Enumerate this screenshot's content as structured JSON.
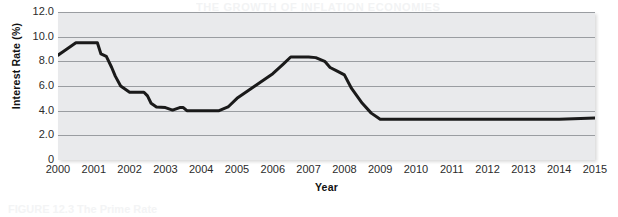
{
  "figure": {
    "background_color": "#ffffff",
    "plot_background_color": "#e9eaec",
    "gridline_color": "#9a9da1",
    "series_color": "#1a1a1a",
    "ghost_text_top": "THE GROWTH OF INFLATION ECONOMIES",
    "ghost_text_bottom": "FIGURE 12.3 The Prime Rate"
  },
  "chart_data": {
    "type": "line",
    "title": "",
    "xlabel": "Year",
    "ylabel": "Interest Rate (%)",
    "xlim": [
      2000,
      2015
    ],
    "ylim": [
      0,
      12
    ],
    "grid": true,
    "legend": "none",
    "ytick_labels": [
      "12.0",
      "10.0",
      "8.0",
      "6.0",
      "4.0",
      "2.0",
      "0"
    ],
    "ytick_values": [
      12,
      10,
      8,
      6,
      4,
      2,
      0
    ],
    "xtick_labels": [
      "2000",
      "2001",
      "2002",
      "2003",
      "2004",
      "2005",
      "2006",
      "2007",
      "2008",
      "2009",
      "2010",
      "2011",
      "2012",
      "2013",
      "2014",
      "2015"
    ],
    "xtick_values": [
      2000,
      2001,
      2002,
      2003,
      2004,
      2005,
      2006,
      2007,
      2008,
      2009,
      2010,
      2011,
      2012,
      2013,
      2014,
      2015
    ],
    "series": [
      {
        "name": "Interest Rate",
        "x": [
          2000.0,
          2000.15,
          2000.35,
          2000.5,
          2000.6,
          2000.75,
          2001.0,
          2001.1,
          2001.2,
          2001.35,
          2001.5,
          2001.6,
          2001.75,
          2002.0,
          2002.4,
          2002.5,
          2002.6,
          2002.75,
          2003.0,
          2003.2,
          2003.4,
          2003.5,
          2003.6,
          2004.0,
          2004.5,
          2004.75,
          2005.0,
          2005.5,
          2006.0,
          2006.3,
          2006.5,
          2007.0,
          2007.2,
          2007.45,
          2007.6,
          2007.8,
          2008.0,
          2008.2,
          2008.5,
          2008.75,
          2009.0,
          2010.0,
          2011.0,
          2012.0,
          2013.0,
          2014.0,
          2015.0
        ],
        "y": [
          8.5,
          8.8,
          9.2,
          9.5,
          9.5,
          9.5,
          9.5,
          9.5,
          8.6,
          8.4,
          7.5,
          6.8,
          6.0,
          5.5,
          5.5,
          5.2,
          4.6,
          4.3,
          4.25,
          4.05,
          4.25,
          4.25,
          4.0,
          4.0,
          4.0,
          4.3,
          5.0,
          6.0,
          7.0,
          7.8,
          8.35,
          8.35,
          8.3,
          8.0,
          7.5,
          7.2,
          6.9,
          5.8,
          4.6,
          3.8,
          3.3,
          3.3,
          3.3,
          3.3,
          3.3,
          3.3,
          3.4
        ]
      }
    ]
  }
}
